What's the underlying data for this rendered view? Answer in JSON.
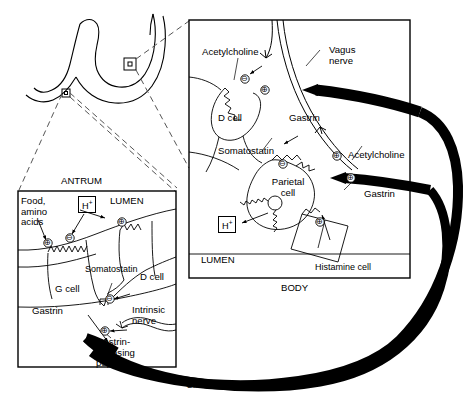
{
  "figure": {
    "type": "biomedical-diagram"
  },
  "stomach": {
    "name": "stomach-outline",
    "callout_antrum_label": "antrum-callout-marker",
    "callout_body_label": "body-callout-marker"
  },
  "antrum_panel": {
    "caption": "ANTRUM",
    "lumen": "LUMEN",
    "food": "Food,\namino\nacids",
    "acid": "H",
    "acid_sup": "+",
    "somatostatin": "Somatostatin",
    "d_cell": "D cell",
    "g_cell": "G cell",
    "gastrin": "Gastrin",
    "intrinsic_nerve": "Intrinsic\nnerve",
    "grp": "Gastrin-\nreleasing\npeptide",
    "symbols": {
      "plus": "⊕",
      "minus": "⊖"
    }
  },
  "body_panel": {
    "caption": "BODY",
    "lumen": "LUMEN",
    "acetylcholine_top": "Acetylcholine",
    "acetylcholine_right": "Acetylcholine",
    "vagus_nerve": "Vagus\nnerve",
    "d_cell": "D cell",
    "gastrin_top": "Gastrin",
    "gastrin_right": "Gastrin",
    "somatostatin": "Somatostatin",
    "parietal_cell": "Parietal\ncell",
    "acid": "H",
    "acid_sup": "+",
    "histamine_cell": "Histamine cell",
    "symbols": {
      "plus": "⊕",
      "minus": "⊖"
    }
  },
  "circulation": {
    "label": "Circulation",
    "color": "#000000"
  },
  "colors": {
    "ink": "#000000",
    "background": "#ffffff",
    "dash": "#555555"
  }
}
